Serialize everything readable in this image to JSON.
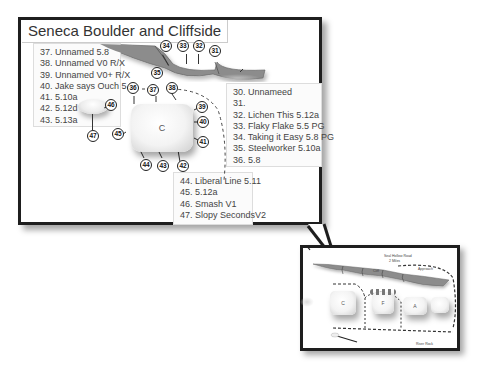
{
  "title": "Seneca Boulder and Cliffside",
  "legend_left": {
    "items": [
      "37.  Unnamed  5.8",
      "38. Unnamed V0 R/X",
      "39. Unnamed V0+ R/X",
      "40.  Jake says Ouch 5.8",
      "41.  5.10a",
      "42.  5.12d",
      "43.  5.13a"
    ]
  },
  "legend_right": {
    "items": [
      "30. Unnameed",
      "31.",
      "32. Lichen This 5.12a",
      "33. Flaky Flake 5.5 PG",
      "34. Taking it Easy 5.8 PG",
      "35. Steelworker 5.10a",
      "36. 5.8"
    ]
  },
  "legend_bottom": {
    "items": [
      "44. Liberal Line 5.11",
      "45. 5.12a",
      "46. Smash V1",
      "47. Slopy SecondsV2"
    ]
  },
  "markers": {
    "m31": "31",
    "m32": "32",
    "m33": "33",
    "m34": "34",
    "m35": "35",
    "m36": "36",
    "m37": "37",
    "m38": "38",
    "m39": "39",
    "m40": "40",
    "m41": "41",
    "m42": "42",
    "m43": "43",
    "m44": "44",
    "m45": "45",
    "m46": "46",
    "m47": "47"
  },
  "boulder_main": {
    "label": "C"
  },
  "inset": {
    "road_label": "Seal Hollow Road",
    "road_sub": "2 Miles",
    "cliff_label": "Cliff",
    "path_label": "Approach",
    "rock_label": "River Rock",
    "boulders": [
      "C",
      "F",
      "A",
      ""
    ]
  },
  "colors": {
    "frame": "#1e1e1e",
    "cliff": "#8c8c8c",
    "boulder": "#f3f3f3",
    "text": "#444444"
  }
}
